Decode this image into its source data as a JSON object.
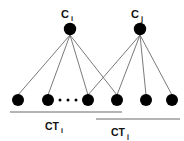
{
  "figure": {
    "kind": "bipartite-cluster-diagram",
    "background_color": "#ffffff",
    "node_color": "#000000",
    "edge_color": "#6b6b6b",
    "bracket_color": "#6b6b6b",
    "text_color": "#111111"
  },
  "top_nodes": [
    {
      "id": "c-i",
      "label_base": "C",
      "label_sub": "i",
      "cx": 70,
      "cy": 29,
      "r": 6.2
    },
    {
      "id": "c-j",
      "label_base": "C",
      "label_sub": "j",
      "cx": 140,
      "cy": 29,
      "r": 6.2
    }
  ],
  "bottom_nodes": [
    {
      "id": "b1",
      "cx": 18,
      "cy": 100,
      "r": 6.0
    },
    {
      "id": "b2",
      "cx": 48,
      "cy": 100,
      "r": 6.0
    },
    {
      "id": "b3",
      "cx": 88,
      "cy": 100,
      "r": 6.0
    },
    {
      "id": "b4",
      "cx": 117,
      "cy": 100,
      "r": 6.0
    },
    {
      "id": "b5",
      "cx": 146,
      "cy": 100,
      "r": 6.0
    },
    {
      "id": "b6",
      "cx": 172,
      "cy": 100,
      "r": 6.0
    }
  ],
  "ellipsis": {
    "id": "bottom-row-ellipsis",
    "dots": [
      {
        "cx": 60,
        "cy": 100,
        "r": 1.5
      },
      {
        "cx": 68,
        "cy": 100,
        "r": 1.5
      },
      {
        "cx": 76,
        "cy": 100,
        "r": 1.5
      }
    ]
  },
  "edges": [
    {
      "id": "e-ci-b1",
      "from": "c-i",
      "to": "b1",
      "x1": 70,
      "y1": 35,
      "x2": 18,
      "y2": 95
    },
    {
      "id": "e-ci-b2",
      "from": "c-i",
      "to": "b2",
      "x1": 70,
      "y1": 35,
      "x2": 48,
      "y2": 95
    },
    {
      "id": "e-ci-b3",
      "from": "c-i",
      "to": "b3",
      "x1": 70,
      "y1": 35,
      "x2": 88,
      "y2": 95
    },
    {
      "id": "e-ci-b4",
      "from": "c-i",
      "to": "b4",
      "x1": 70,
      "y1": 35,
      "x2": 117,
      "y2": 95
    },
    {
      "id": "e-cj-b3",
      "from": "c-j",
      "to": "b3",
      "x1": 140,
      "y1": 35,
      "x2": 88,
      "y2": 95
    },
    {
      "id": "e-cj-b4",
      "from": "c-j",
      "to": "b4",
      "x1": 140,
      "y1": 35,
      "x2": 117,
      "y2": 95
    },
    {
      "id": "e-cj-b5",
      "from": "c-j",
      "to": "b5",
      "x1": 140,
      "y1": 35,
      "x2": 146,
      "y2": 95
    },
    {
      "id": "e-cj-b6",
      "from": "c-j",
      "to": "b6",
      "x1": 140,
      "y1": 35,
      "x2": 172,
      "y2": 95
    }
  ],
  "brackets": [
    {
      "id": "ct-i",
      "label_base": "CT",
      "label_sub": "i",
      "x1": 10,
      "x2": 122,
      "y": 112,
      "label_x": 52,
      "label_y": 130
    },
    {
      "id": "ct-j",
      "label_base": "CT",
      "label_sub": "j",
      "x1": 96,
      "x2": 180,
      "y": 119,
      "label_x": 118,
      "label_y": 136
    }
  ]
}
